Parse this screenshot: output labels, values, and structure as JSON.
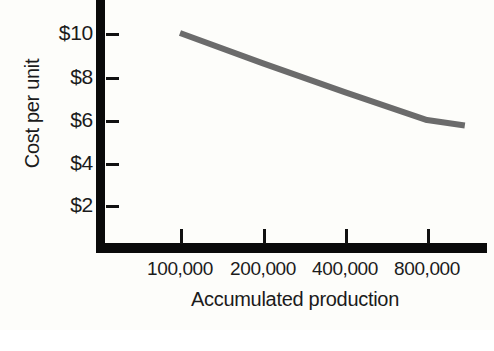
{
  "figure": {
    "background_color": "#fdfdfa",
    "axis_color": "#0a0a0a",
    "line_color": "#6b6b6b",
    "text_color": "#1b1b1b"
  },
  "chart_data": {
    "type": "line",
    "title": "",
    "subtitle": "",
    "xlabel": "Accumulated production",
    "ylabel": "Cost per unit",
    "xscale": "log2",
    "grid": false,
    "legend": null,
    "x_tick_labels": [
      "100,000",
      "200,000",
      "400,000",
      "800,000"
    ],
    "x_tick_values": [
      100000,
      200000,
      400000,
      800000
    ],
    "y_tick_labels": [
      "$2",
      "$4",
      "$6",
      "$8",
      "$10"
    ],
    "y_tick_values": [
      2,
      4,
      6,
      8,
      10
    ],
    "ylim": [
      0,
      11.5
    ],
    "xlim": [
      70000,
      1300000
    ],
    "series": [
      {
        "name": "Unit cost",
        "x": [
          100000,
          200000,
          400000,
          800000,
          1100000
        ],
        "values": [
          10.0,
          8.6,
          7.25,
          5.95,
          5.7
        ],
        "line_color": "#6b6b6b",
        "line_width": 6
      }
    ],
    "annotations": []
  },
  "axes": {
    "y_title": "Cost per unit",
    "x_title": "Accumulated production",
    "y_ticks": [
      {
        "label": "$10",
        "y": 33
      },
      {
        "label": "$8",
        "y": 77
      },
      {
        "label": "$6",
        "y": 120
      },
      {
        "label": "$4",
        "y": 163
      },
      {
        "label": "$2",
        "y": 205
      }
    ],
    "x_ticks": [
      {
        "label": "100,000",
        "x": 180
      },
      {
        "label": "200,000",
        "x": 263
      },
      {
        "label": "400,000",
        "x": 345
      },
      {
        "label": "800,000",
        "x": 427
      }
    ]
  }
}
